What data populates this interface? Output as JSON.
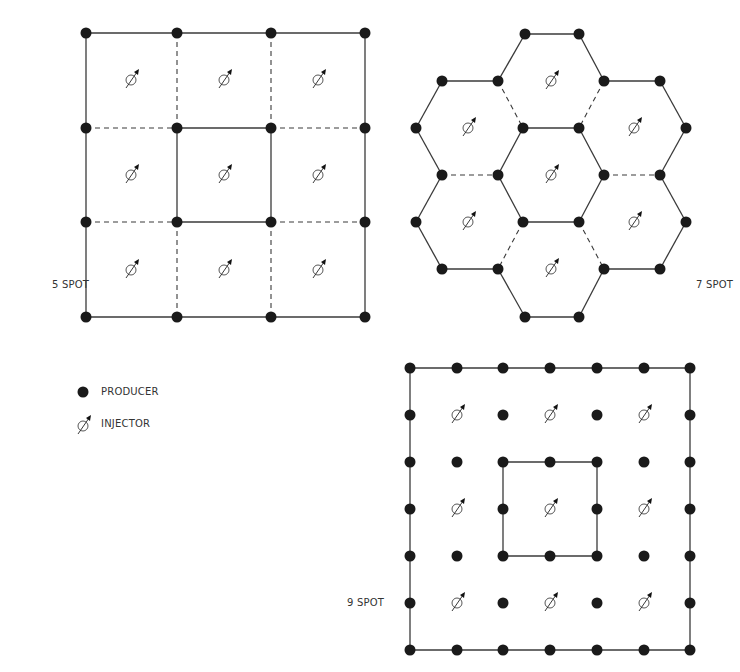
{
  "colors": {
    "ink": "#1a1a1a",
    "line": "#3a3a3a",
    "background": "#ffffff"
  },
  "patterns": [
    {
      "id": "five-spot",
      "label": "5 SPOT",
      "label_pos": [
        52,
        287
      ],
      "producers": [
        [
          86,
          33
        ],
        [
          177,
          33
        ],
        [
          271,
          33
        ],
        [
          365,
          33
        ],
        [
          86,
          128
        ],
        [
          177,
          128
        ],
        [
          271,
          128
        ],
        [
          365,
          128
        ],
        [
          86,
          222
        ],
        [
          177,
          222
        ],
        [
          271,
          222
        ],
        [
          365,
          222
        ],
        [
          86,
          317
        ],
        [
          177,
          317
        ],
        [
          271,
          317
        ],
        [
          365,
          317
        ]
      ],
      "solid_lines": [
        [
          [
            86,
            33
          ],
          [
            365,
            33
          ]
        ],
        [
          [
            86,
            317
          ],
          [
            365,
            317
          ]
        ],
        [
          [
            86,
            33
          ],
          [
            86,
            317
          ]
        ],
        [
          [
            365,
            33
          ],
          [
            365,
            317
          ]
        ],
        [
          [
            177,
            128
          ],
          [
            271,
            128
          ]
        ],
        [
          [
            177,
            222
          ],
          [
            271,
            222
          ]
        ],
        [
          [
            177,
            128
          ],
          [
            177,
            222
          ]
        ],
        [
          [
            271,
            128
          ],
          [
            271,
            222
          ]
        ]
      ],
      "dashed_lines": [
        [
          [
            177,
            33
          ],
          [
            177,
            128
          ]
        ],
        [
          [
            271,
            33
          ],
          [
            271,
            128
          ]
        ],
        [
          [
            177,
            222
          ],
          [
            177,
            317
          ]
        ],
        [
          [
            271,
            222
          ],
          [
            271,
            317
          ]
        ],
        [
          [
            86,
            128
          ],
          [
            177,
            128
          ]
        ],
        [
          [
            271,
            128
          ],
          [
            365,
            128
          ]
        ],
        [
          [
            86,
            222
          ],
          [
            177,
            222
          ]
        ],
        [
          [
            271,
            222
          ],
          [
            365,
            222
          ]
        ]
      ],
      "injectors": [
        [
          131,
          80
        ],
        [
          224,
          80
        ],
        [
          318,
          80
        ],
        [
          131,
          175
        ],
        [
          224,
          175
        ],
        [
          318,
          175
        ],
        [
          131,
          270
        ],
        [
          224,
          270
        ],
        [
          318,
          270
        ]
      ]
    },
    {
      "id": "seven-spot",
      "label": "7 SPOT",
      "label_pos": [
        696,
        280
      ],
      "producers": [
        [
          525,
          34
        ],
        [
          579,
          34
        ],
        [
          442,
          81
        ],
        [
          498,
          81
        ],
        [
          604,
          81
        ],
        [
          660,
          81
        ],
        [
          416,
          128
        ],
        [
          523,
          128
        ],
        [
          579,
          128
        ],
        [
          686,
          128
        ],
        [
          442,
          175
        ],
        [
          498,
          175
        ],
        [
          604,
          175
        ],
        [
          660,
          175
        ],
        [
          416,
          222
        ],
        [
          523,
          222
        ],
        [
          579,
          222
        ],
        [
          686,
          222
        ],
        [
          442,
          269
        ],
        [
          498,
          269
        ],
        [
          604,
          269
        ],
        [
          660,
          269
        ],
        [
          525,
          317
        ],
        [
          579,
          317
        ]
      ],
      "solid_lines": [
        [
          [
            525,
            34
          ],
          [
            579,
            34
          ]
        ],
        [
          [
            579,
            34
          ],
          [
            604,
            81
          ]
        ],
        [
          [
            498,
            81
          ],
          [
            525,
            34
          ]
        ],
        [
          [
            442,
            81
          ],
          [
            498,
            81
          ]
        ],
        [
          [
            604,
            81
          ],
          [
            660,
            81
          ]
        ],
        [
          [
            442,
            81
          ],
          [
            416,
            128
          ]
        ],
        [
          [
            660,
            81
          ],
          [
            686,
            128
          ]
        ],
        [
          [
            523,
            128
          ],
          [
            579,
            128
          ]
        ],
        [
          [
            416,
            128
          ],
          [
            442,
            175
          ]
        ],
        [
          [
            686,
            128
          ],
          [
            660,
            175
          ]
        ],
        [
          [
            523,
            128
          ],
          [
            498,
            175
          ]
        ],
        [
          [
            579,
            128
          ],
          [
            604,
            175
          ]
        ],
        [
          [
            498,
            175
          ],
          [
            523,
            222
          ]
        ],
        [
          [
            604,
            175
          ],
          [
            579,
            222
          ]
        ],
        [
          [
            442,
            175
          ],
          [
            416,
            222
          ]
        ],
        [
          [
            660,
            175
          ],
          [
            686,
            222
          ]
        ],
        [
          [
            523,
            222
          ],
          [
            579,
            222
          ]
        ],
        [
          [
            416,
            222
          ],
          [
            442,
            269
          ]
        ],
        [
          [
            686,
            222
          ],
          [
            660,
            269
          ]
        ],
        [
          [
            442,
            269
          ],
          [
            498,
            269
          ]
        ],
        [
          [
            604,
            269
          ],
          [
            660,
            269
          ]
        ],
        [
          [
            498,
            269
          ],
          [
            525,
            317
          ]
        ],
        [
          [
            604,
            269
          ],
          [
            579,
            317
          ]
        ],
        [
          [
            525,
            317
          ],
          [
            579,
            317
          ]
        ],
        [
          [
            498,
            81
          ],
          [
            498,
            81
          ]
        ]
      ],
      "dashed_lines": [
        [
          [
            498,
            81
          ],
          [
            523,
            128
          ]
        ],
        [
          [
            604,
            81
          ],
          [
            579,
            128
          ]
        ],
        [
          [
            442,
            175
          ],
          [
            498,
            175
          ]
        ],
        [
          [
            604,
            175
          ],
          [
            660,
            175
          ]
        ],
        [
          [
            523,
            222
          ],
          [
            498,
            269
          ]
        ],
        [
          [
            579,
            222
          ],
          [
            604,
            269
          ]
        ]
      ],
      "injectors": [
        [
          551,
          81
        ],
        [
          468,
          128
        ],
        [
          634,
          128
        ],
        [
          551,
          175
        ],
        [
          468,
          222
        ],
        [
          634,
          222
        ],
        [
          551,
          269
        ]
      ]
    },
    {
      "id": "nine-spot",
      "label": "9 SPOT",
      "label_pos": [
        347,
        604
      ],
      "producers": [
        [
          410,
          368
        ],
        [
          457,
          368
        ],
        [
          503,
          368
        ],
        [
          550,
          368
        ],
        [
          597,
          368
        ],
        [
          644,
          368
        ],
        [
          690,
          368
        ],
        [
          410,
          415
        ],
        [
          503,
          415
        ],
        [
          597,
          415
        ],
        [
          690,
          415
        ],
        [
          410,
          462
        ],
        [
          457,
          462
        ],
        [
          503,
          462
        ],
        [
          550,
          462
        ],
        [
          597,
          462
        ],
        [
          644,
          462
        ],
        [
          690,
          462
        ],
        [
          410,
          509
        ],
        [
          503,
          509
        ],
        [
          597,
          509
        ],
        [
          690,
          509
        ],
        [
          410,
          556
        ],
        [
          457,
          556
        ],
        [
          503,
          556
        ],
        [
          550,
          556
        ],
        [
          597,
          556
        ],
        [
          644,
          556
        ],
        [
          690,
          556
        ],
        [
          410,
          603
        ],
        [
          503,
          603
        ],
        [
          597,
          603
        ],
        [
          690,
          603
        ],
        [
          410,
          650
        ],
        [
          457,
          650
        ],
        [
          503,
          650
        ],
        [
          550,
          650
        ],
        [
          597,
          650
        ],
        [
          644,
          650
        ],
        [
          690,
          650
        ]
      ],
      "solid_lines": [
        [
          [
            410,
            368
          ],
          [
            690,
            368
          ]
        ],
        [
          [
            410,
            650
          ],
          [
            690,
            650
          ]
        ],
        [
          [
            410,
            368
          ],
          [
            410,
            650
          ]
        ],
        [
          [
            690,
            368
          ],
          [
            690,
            650
          ]
        ],
        [
          [
            503,
            462
          ],
          [
            597,
            462
          ]
        ],
        [
          [
            503,
            556
          ],
          [
            597,
            556
          ]
        ],
        [
          [
            503,
            462
          ],
          [
            503,
            556
          ]
        ],
        [
          [
            597,
            462
          ],
          [
            597,
            556
          ]
        ]
      ],
      "dashed_lines": [],
      "injectors": [
        [
          457,
          415
        ],
        [
          550,
          415
        ],
        [
          644,
          415
        ],
        [
          457,
          509
        ],
        [
          550,
          509
        ],
        [
          644,
          509
        ],
        [
          457,
          603
        ],
        [
          550,
          603
        ],
        [
          644,
          603
        ]
      ]
    }
  ],
  "legend": {
    "items": [
      {
        "symbol": "producer-dot",
        "label": "PRODUCER",
        "pos": [
          83,
          392
        ]
      },
      {
        "symbol": "injector-symbol",
        "label": "INJECTOR",
        "pos": [
          83,
          424
        ]
      }
    ]
  }
}
